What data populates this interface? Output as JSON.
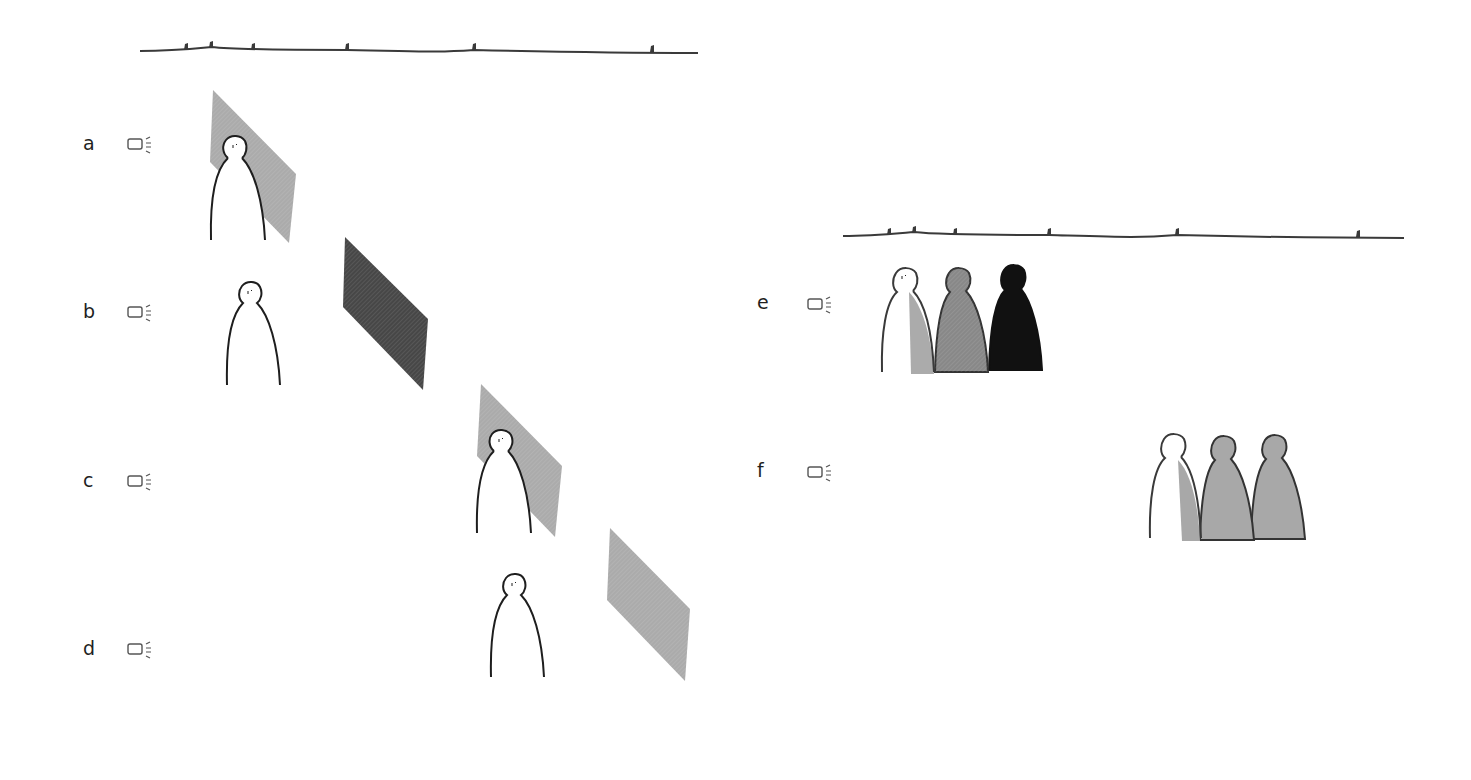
{
  "figure": {
    "colors": {
      "background": "#ffffff",
      "outline": "#1e1e1e",
      "light_gray": "#a9a9a9",
      "mid_gray": "#8a8a8a",
      "dark_gray": "#4a4a4a",
      "black": "#111111"
    }
  },
  "left_group": {
    "timeline": {
      "x1": 140,
      "x2": 698,
      "y": 50,
      "marker_xs": [
        186,
        211,
        253,
        347,
        474,
        652
      ]
    },
    "panels": [
      {
        "label": "a",
        "label_pos": [
          83,
          133
        ],
        "icon": "light-source-icon",
        "icon_pos": [
          128,
          137
        ],
        "plane": {
          "shade": "light_gray",
          "points": "212,90 212,160 289,243 296,175"
        },
        "person": {
          "x": 210,
          "top": 134,
          "bottom": 242,
          "front": true
        }
      },
      {
        "label": "b",
        "label_pos": [
          83,
          301
        ],
        "icon": "light-source-icon",
        "icon_pos": [
          128,
          305
        ],
        "plane": {
          "shade": "dark_gray",
          "points": "345,237 343,306 424,390 429,319"
        },
        "person": {
          "x": 226,
          "top": 282,
          "bottom": 388,
          "front": false
        }
      },
      {
        "label": "c",
        "label_pos": [
          83,
          470
        ],
        "icon": "light-source-icon",
        "icon_pos": [
          128,
          474
        ],
        "plane": {
          "shade": "light_gray",
          "points": "480,384 477,455 555,537 562,466"
        },
        "person": {
          "x": 476,
          "top": 428,
          "bottom": 535,
          "front": true
        }
      },
      {
        "label": "d",
        "label_pos": [
          83,
          638
        ],
        "icon": "light-source-icon",
        "icon_pos": [
          128,
          642
        ],
        "plane": {
          "shade": "light_gray",
          "points": "610,528 607,600 685,681 690,609"
        },
        "person": {
          "x": 490,
          "top": 572,
          "bottom": 679,
          "front": false
        }
      }
    ]
  },
  "right_group": {
    "timeline": {
      "x1": 843,
      "x2": 1404,
      "y": 235,
      "marker_xs": [
        889,
        914,
        955,
        1049,
        1177,
        1358
      ]
    },
    "panels": [
      {
        "label": "e",
        "label_pos": [
          757,
          292
        ],
        "icon": "light-source-icon",
        "icon_pos": [
          806,
          296
        ],
        "figures": [
          {
            "x": 880,
            "fill": "half_light",
            "top": 265,
            "bottom": 372
          },
          {
            "x": 934,
            "fill": "mid_gray",
            "top": 265,
            "bottom": 372
          },
          {
            "x": 988,
            "fill": "black",
            "top": 263,
            "bottom": 370
          }
        ]
      },
      {
        "label": "f",
        "label_pos": [
          757,
          460
        ],
        "icon": "light-source-icon",
        "icon_pos": [
          806,
          464
        ],
        "figures": [
          {
            "x": 1149,
            "fill": "half_gray",
            "top": 431,
            "bottom": 540
          },
          {
            "x": 1199,
            "fill": "light_gray",
            "top": 431,
            "bottom": 540
          },
          {
            "x": 1250,
            "fill": "light_gray",
            "top": 431,
            "bottom": 540
          }
        ]
      }
    ]
  }
}
